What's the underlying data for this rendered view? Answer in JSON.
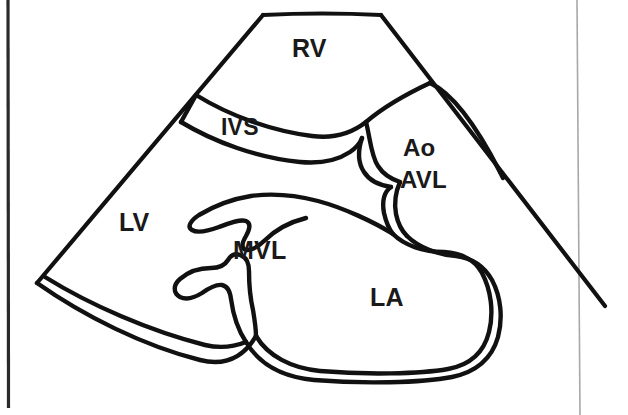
{
  "figure": {
    "kind": "echocardiogram-schematic",
    "view": "parasternal-long-axis",
    "background_color": "#ffffff",
    "ink_color": "#111111",
    "artifact_color": "#9a9a9a"
  },
  "labels": {
    "rv": "RV",
    "ivs": "IVS",
    "ao": "Ao",
    "avl": "AVL",
    "lv": "LV",
    "mvl": "MVL",
    "la": "LA"
  },
  "structures": [
    {
      "id": "rv",
      "abbr": "RV",
      "x": 292,
      "y": 36
    },
    {
      "id": "ivs",
      "abbr": "IVS",
      "x": 221,
      "y": 116
    },
    {
      "id": "ao",
      "abbr": "Ao",
      "x": 403,
      "y": 136
    },
    {
      "id": "avl",
      "abbr": "AVL",
      "x": 400,
      "y": 168
    },
    {
      "id": "lv",
      "abbr": "LV",
      "x": 119,
      "y": 210
    },
    {
      "id": "mvl",
      "abbr": "MVL",
      "x": 233,
      "y": 238
    },
    {
      "id": "la",
      "abbr": "LA",
      "x": 370,
      "y": 285
    }
  ],
  "page_artifacts": {
    "left_border": "vertical dark scan edge",
    "right_rule": "thin vertical grey line"
  }
}
